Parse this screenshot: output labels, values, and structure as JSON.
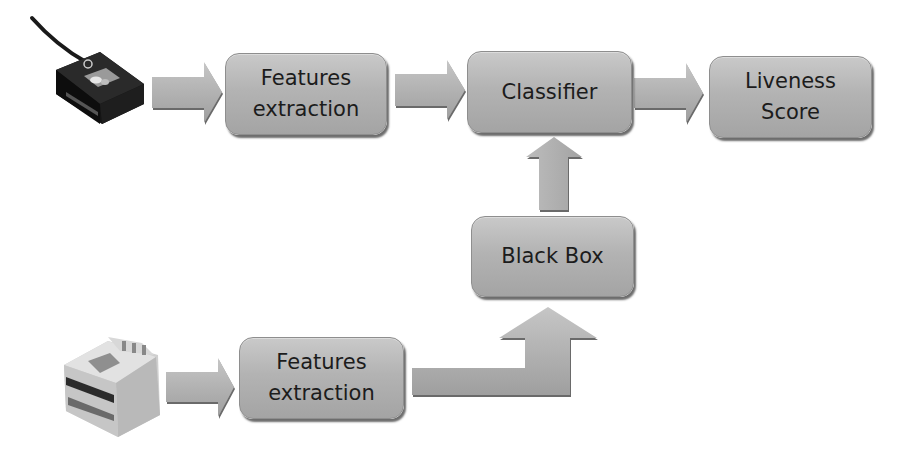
{
  "diagram": {
    "nodes": {
      "features_top": {
        "line1": "Features",
        "line2": "extraction"
      },
      "classifier": {
        "label": "Classifier"
      },
      "liveness": {
        "line1": "Liveness",
        "line2": "Score"
      },
      "black_box": {
        "label": "Black Box"
      },
      "features_bottom": {
        "line1": "Features",
        "line2": "extraction"
      }
    },
    "devices": {
      "top": "fingerprint-scanner-small",
      "bottom": "fingerprint-scanner-large"
    },
    "edges": [
      {
        "from": "device-top",
        "to": "features_top"
      },
      {
        "from": "features_top",
        "to": "classifier"
      },
      {
        "from": "classifier",
        "to": "liveness"
      },
      {
        "from": "black_box",
        "to": "classifier"
      },
      {
        "from": "device-bottom",
        "to": "features_bottom"
      },
      {
        "from": "features_bottom",
        "to": "black_box"
      }
    ],
    "colors": {
      "box_fill": "#b3b3b3",
      "arrow_fill": "#b0b0b0",
      "text": "#1c1c1c",
      "background": "#ffffff"
    }
  }
}
